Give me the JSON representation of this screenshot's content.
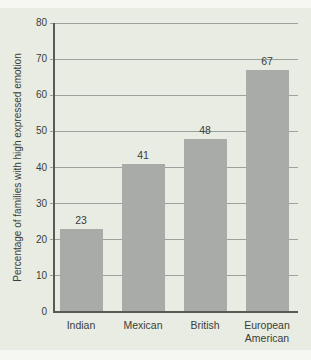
{
  "figure": {
    "kind": "bar-chart-figure",
    "title": "",
    "ylabel": "Percentage of families with high expressed emotion"
  },
  "chart_data": {
    "type": "bar",
    "categories": [
      "Indian",
      "Mexican",
      "British",
      "European American"
    ],
    "values": [
      23,
      41,
      48,
      67
    ],
    "value_labels": [
      "23",
      "41",
      "48",
      "67"
    ],
    "title": "",
    "xlabel": "",
    "ylabel": "Percentage of families with high expressed emotion",
    "ylim": [
      0,
      80
    ],
    "yticks": [
      0,
      10,
      20,
      30,
      40,
      50,
      60,
      70,
      80
    ],
    "grid": true,
    "legend": null,
    "bar_orientation": "vertical"
  },
  "colors": {
    "page_band": "#f6f6f3",
    "panel_bg": "#e8ece3",
    "bar_fill": "#a9aba8",
    "grid_line": "#9aa29b",
    "axis_line": "#565b54",
    "text": "#3a3d38"
  }
}
